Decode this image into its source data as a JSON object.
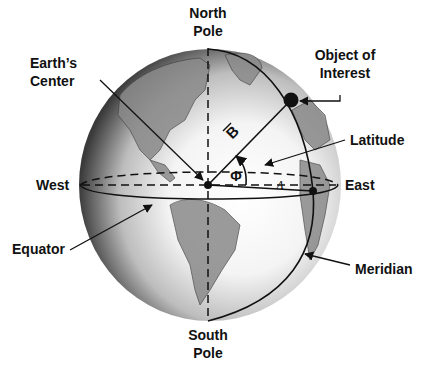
{
  "labels": {
    "north_pole": [
      "North",
      "Pole"
    ],
    "south_pole": [
      "South",
      "Pole"
    ],
    "object_of_interest": [
      "Object of",
      "Interest"
    ],
    "earths_center": [
      "Earth’s",
      "Center"
    ],
    "latitude": "Latitude",
    "west": "West",
    "east": "East",
    "equator": "Equator",
    "meridian": "Meridian"
  },
  "symbols": {
    "vector": "B",
    "latitude_angle": "Φ",
    "longitude_angle": "Λ"
  },
  "colors": {
    "ink": "#111111",
    "globe_light": "#ffffff",
    "globe_dark": "#3a3a3a",
    "land": "#7a7a7a"
  }
}
